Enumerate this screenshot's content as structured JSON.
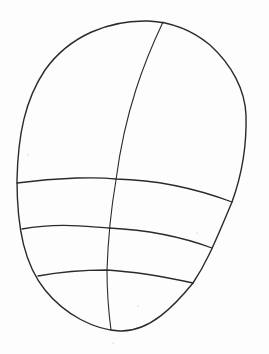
{
  "drawing": {
    "subject": "head outline sketch with construction guide lines",
    "stroke_color": "#2a2a2a",
    "background_color": "#fdfdfd",
    "outline": "M148,21 C110,20 70,35 45,70 C25,100 18,135 17,180 C17,230 25,265 45,290 C65,315 95,330 120,331 C150,332 175,305 193,283 C205,265 212,250 232,202 C240,180 247,150 246,115 C245,90 232,65 210,45 C192,30 170,22 148,21 Z",
    "center_line": "M163,22 C145,60 125,110 116,180 C110,215 108,240 107,270 C107,295 109,315 111,330",
    "guide_lines": [
      {
        "name": "brow-line",
        "d": "M17,183 C60,177 100,177 116,179 C160,180 200,190 232,202"
      },
      {
        "name": "nose-line",
        "d": "M22,229 C60,222 90,227 109,228 C150,230 185,238 212,248"
      },
      {
        "name": "mouth-line",
        "d": "M38,276 C70,270 95,270 107,270 C140,272 170,278 193,283"
      }
    ],
    "stray_marks": [
      {
        "x": 28,
        "y": 155
      },
      {
        "x": 113,
        "y": 343
      },
      {
        "x": 138,
        "y": 306
      },
      {
        "x": 197,
        "y": 233
      }
    ]
  }
}
